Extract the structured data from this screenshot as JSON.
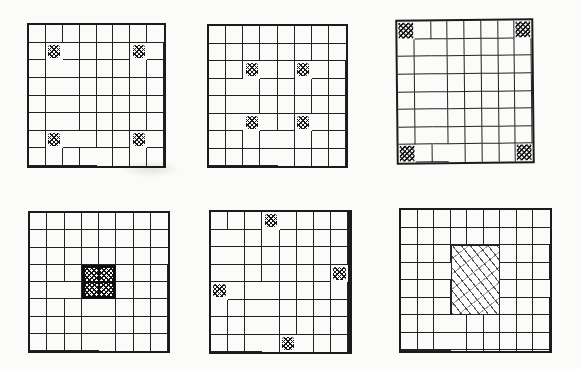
{
  "figure": {
    "ink_color": "#1b1b1b",
    "paper_color": "#fbfbf9",
    "grids": [
      {
        "id": "top-left",
        "cols": 8,
        "rows": 8,
        "pos": {
          "left": 27,
          "top": 23,
          "width": 139,
          "height": 145
        },
        "mark_size": "small",
        "marks": [
          {
            "row": 1,
            "col": 1
          },
          {
            "row": 1,
            "col": 6
          },
          {
            "row": 6,
            "col": 1
          },
          {
            "row": 6,
            "col": 6
          }
        ],
        "blocks": []
      },
      {
        "id": "top-middle",
        "cols": 8,
        "rows": 8,
        "pos": {
          "left": 207,
          "top": 24,
          "width": 141,
          "height": 144
        },
        "mark_size": "small",
        "marks": [
          {
            "row": 2,
            "col": 2
          },
          {
            "row": 2,
            "col": 5
          },
          {
            "row": 5,
            "col": 2
          },
          {
            "row": 5,
            "col": 5
          }
        ],
        "blocks": []
      },
      {
        "id": "top-right",
        "cols": 8,
        "rows": 8,
        "pos": {
          "left": 396,
          "top": 19,
          "width": 138,
          "height": 145
        },
        "rotate": -0.6,
        "mark_size": "large",
        "marks": [
          {
            "row": 0,
            "col": 0
          },
          {
            "row": 0,
            "col": 7
          },
          {
            "row": 7,
            "col": 0
          },
          {
            "row": 7,
            "col": 7
          }
        ],
        "blocks": []
      },
      {
        "id": "bottom-left",
        "cols": 8,
        "rows": 8,
        "pos": {
          "left": 28,
          "top": 211,
          "width": 142,
          "height": 142
        },
        "mark_size": "small",
        "marks": [],
        "blocks": [
          {
            "row": 3,
            "col": 3,
            "rowspan": 2,
            "colspan": 2,
            "style": "dense-crosshatch-bold"
          }
        ]
      },
      {
        "id": "bottom-middle",
        "cols": 8,
        "rows": 8,
        "pos": {
          "left": 209,
          "top": 210,
          "width": 143,
          "height": 144
        },
        "thick_right_edge": true,
        "mark_size": "small",
        "marks": [
          {
            "row": 0,
            "col": 3
          },
          {
            "row": 3,
            "col": 7
          },
          {
            "row": 4,
            "col": 0
          },
          {
            "row": 7,
            "col": 4
          }
        ],
        "blocks": []
      },
      {
        "id": "bottom-right",
        "cols": 9,
        "rows": 8,
        "pos": {
          "left": 399,
          "top": 208,
          "width": 153,
          "height": 145
        },
        "mark_size": "small",
        "marks": [],
        "blocks": [
          {
            "row": 2,
            "col": 3,
            "rowspan": 4,
            "colspan": 3,
            "style": "light-sketch-hatch"
          }
        ]
      }
    ]
  }
}
